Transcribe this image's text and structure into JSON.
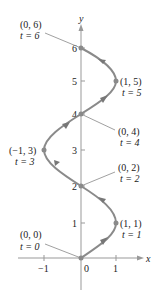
{
  "axes": {
    "x_label": "x",
    "y_label": "y",
    "x_ticks": [
      "−1",
      "0",
      "1"
    ],
    "y_ticks": [
      "1",
      "2",
      "3",
      "4",
      "5",
      "6"
    ]
  },
  "points": [
    {
      "coord": "(0, 0)",
      "t": "t = 0"
    },
    {
      "coord": "(1, 1)",
      "t": "t = 1"
    },
    {
      "coord": "(0, 2)",
      "t": "t = 2"
    },
    {
      "coord": "(−1, 3)",
      "t": "t = 3"
    },
    {
      "coord": "(0, 4)",
      "t": "t = 4"
    },
    {
      "coord": "(1, 5)",
      "t": "t = 5"
    },
    {
      "coord": "(0, 6)",
      "t": "t = 6"
    }
  ],
  "colors": {
    "axis": "#999999",
    "curve": "#8a8a8a",
    "arrow": "#777777",
    "text": "#222222"
  }
}
